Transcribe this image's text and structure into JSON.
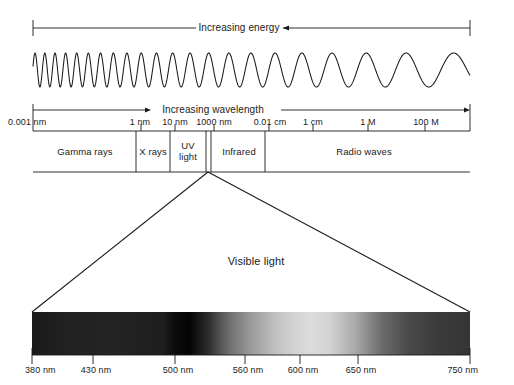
{
  "figure": {
    "background_color": "#ffffff",
    "line_color": "#1a1a1a"
  },
  "energy_axis": {
    "label": "Increasing energy",
    "direction": "left",
    "x_start": 33,
    "x_end": 470,
    "y": 28
  },
  "wavelength_axis": {
    "label": "Increasing wavelength",
    "direction": "right",
    "x_start": 33,
    "x_end": 470,
    "y": 110,
    "ticks": [
      {
        "label": "0.001 nm",
        "x": 33,
        "align": "left"
      },
      {
        "label": "1 nm",
        "x": 141,
        "align": "center"
      },
      {
        "label": "10 nm",
        "x": 175,
        "align": "center"
      },
      {
        "label": "1000 nm",
        "x": 214,
        "align": "center"
      },
      {
        "label": "0.01 cm",
        "x": 269,
        "align": "center"
      },
      {
        "label": "1 cm",
        "x": 313,
        "align": "center"
      },
      {
        "label": "1 M",
        "x": 368,
        "align": "center"
      },
      {
        "label": "100 M",
        "x": 425,
        "align": "center"
      }
    ]
  },
  "wave": {
    "description": "sinusoid with wavelength increasing left to right",
    "x_start": 33,
    "x_end": 470,
    "y_center": 70,
    "amplitude": 17
  },
  "bands": [
    {
      "name": "Gamma rays",
      "label": "Gamma rays",
      "x_start": 33,
      "x_end": 136,
      "lines": [
        "Gamma rays"
      ]
    },
    {
      "name": "X rays",
      "label": "X rays",
      "x_start": 136,
      "x_end": 170,
      "lines": [
        "X rays"
      ]
    },
    {
      "name": "UV light",
      "label": "UV light",
      "x_start": 170,
      "x_end": 206,
      "lines": [
        "UV",
        "light"
      ]
    },
    {
      "name": "Visible",
      "label": "",
      "x_start": 206,
      "x_end": 211,
      "lines": []
    },
    {
      "name": "Infrared",
      "label": "Infrared",
      "x_start": 211,
      "x_end": 265,
      "lines": [
        "Infrared"
      ]
    },
    {
      "name": "Radio waves",
      "label": "Radio waves",
      "x_start": 265,
      "x_end": 470,
      "lines": [
        "Radio waves"
      ]
    }
  ],
  "band_row": {
    "y_top": 131,
    "y_bottom": 172
  },
  "funnel": {
    "apex_x": 208,
    "apex_y": 172,
    "left_x": 32,
    "right_x": 470,
    "base_y": 312,
    "label": "Visible light",
    "label_x": 256,
    "label_y": 262
  },
  "visible_spectrum": {
    "x_start": 32,
    "x_end": 470,
    "y_top": 312,
    "y_bottom": 355,
    "ticks": [
      {
        "label": "380 nm",
        "x": 32,
        "align": "left"
      },
      {
        "label": "430 nm",
        "x": 93,
        "align": "center"
      },
      {
        "label": "500 nm",
        "x": 175,
        "align": "center"
      },
      {
        "label": "560 nm",
        "x": 245,
        "align": "center"
      },
      {
        "label": "600 nm",
        "x": 300,
        "align": "center"
      },
      {
        "label": "650 nm",
        "x": 358,
        "align": "center"
      },
      {
        "label": "750 nm",
        "x": 470,
        "align": "right"
      }
    ],
    "gradient_stops": [
      {
        "offset": "0%",
        "color": "#1a1a1a"
      },
      {
        "offset": "8%",
        "color": "#222222"
      },
      {
        "offset": "20%",
        "color": "#232323"
      },
      {
        "offset": "30%",
        "color": "#1e1e1e"
      },
      {
        "offset": "33%",
        "color": "#0a0a0a"
      },
      {
        "offset": "36%",
        "color": "#050505"
      },
      {
        "offset": "40%",
        "color": "#2a2a2a"
      },
      {
        "offset": "45%",
        "color": "#6e6e6e"
      },
      {
        "offset": "50%",
        "color": "#9a9a9a"
      },
      {
        "offset": "55%",
        "color": "#bdbdbd"
      },
      {
        "offset": "60%",
        "color": "#d4d4d4"
      },
      {
        "offset": "64%",
        "color": "#dcdcdc"
      },
      {
        "offset": "68%",
        "color": "#d2d2d2"
      },
      {
        "offset": "74%",
        "color": "#a8a8a8"
      },
      {
        "offset": "80%",
        "color": "#6a6a6a"
      },
      {
        "offset": "86%",
        "color": "#4a4a4a"
      },
      {
        "offset": "92%",
        "color": "#3c3c3c"
      },
      {
        "offset": "100%",
        "color": "#343434"
      }
    ]
  },
  "chart_data": {
    "type": "diagram",
    "xlabel": "Increasing wavelength",
    "annotations": [
      "Increasing energy",
      "Increasing wavelength",
      "Visible light"
    ],
    "categories": [
      "Gamma rays",
      "X rays",
      "UV light",
      "Visible",
      "Infrared",
      "Radio waves"
    ],
    "wavelength_ticks": [
      "0.001 nm",
      "1 nm",
      "10 nm",
      "1000 nm",
      "0.01 cm",
      "1 cm",
      "1 M",
      "100 M"
    ],
    "visible_ticks": [
      "380 nm",
      "430 nm",
      "500 nm",
      "560 nm",
      "600 nm",
      "650 nm",
      "750 nm"
    ]
  }
}
